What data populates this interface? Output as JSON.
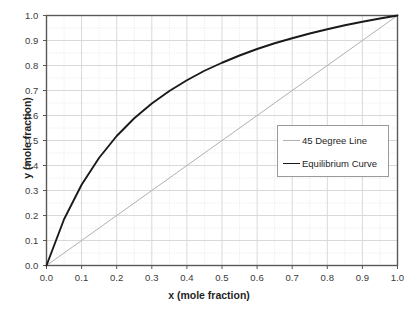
{
  "chart_data": {
    "type": "line",
    "title": "",
    "xlabel": "x (mole fraction)",
    "ylabel": "y (mole fraction)",
    "xlim": [
      0.0,
      1.0
    ],
    "ylim": [
      0.0,
      1.0
    ],
    "xticks": [
      "0.0",
      "0.1",
      "0.2",
      "0.3",
      "0.4",
      "0.5",
      "0.6",
      "0.7",
      "0.8",
      "0.9",
      "1.0"
    ],
    "yticks": [
      "0.0",
      "0.1",
      "0.2",
      "0.3",
      "0.4",
      "0.5",
      "0.6",
      "0.7",
      "0.8",
      "0.9",
      "1.0"
    ],
    "xtick_values": [
      0.0,
      0.1,
      0.2,
      0.3,
      0.4,
      0.5,
      0.6,
      0.7,
      0.8,
      0.9,
      1.0
    ],
    "ytick_values": [
      0.0,
      0.1,
      0.2,
      0.3,
      0.4,
      0.5,
      0.6,
      0.7,
      0.8,
      0.9,
      1.0
    ],
    "grid": true,
    "grid_major_step": 0.1,
    "grid_minor_step": 0.05,
    "legend_position": "center-right",
    "series": [
      {
        "name": "45 Degree Line",
        "color": "#b0b0b0",
        "width": 1.0,
        "x": [
          0.0,
          0.1,
          0.2,
          0.3,
          0.4,
          0.5,
          0.6,
          0.7,
          0.8,
          0.9,
          1.0
        ],
        "values": [
          0.0,
          0.1,
          0.2,
          0.3,
          0.4,
          0.5,
          0.6,
          0.7,
          0.8,
          0.9,
          1.0
        ]
      },
      {
        "name": "Equilibrium Curve",
        "color": "#1a1a1a",
        "width": 1.9,
        "x": [
          0.0,
          0.05,
          0.1,
          0.15,
          0.2,
          0.25,
          0.3,
          0.35,
          0.4,
          0.45,
          0.5,
          0.55,
          0.6,
          0.65,
          0.7,
          0.75,
          0.8,
          0.85,
          0.9,
          0.95,
          1.0
        ],
        "values": [
          0.0,
          0.185,
          0.323,
          0.431,
          0.518,
          0.589,
          0.648,
          0.698,
          0.741,
          0.779,
          0.811,
          0.84,
          0.866,
          0.889,
          0.909,
          0.928,
          0.945,
          0.961,
          0.975,
          0.988,
          1.0
        ]
      }
    ]
  },
  "legend": {
    "entries": [
      {
        "label": "45 Degree Line"
      },
      {
        "label": "Equilibrium Curve"
      }
    ]
  },
  "colors": {
    "equilibrium": "#1a1a1a",
    "diagonal": "#b0b0b0",
    "axis": "#595959",
    "grid_major": "#d9d9d9",
    "grid_minor": "#e8e8e8"
  }
}
